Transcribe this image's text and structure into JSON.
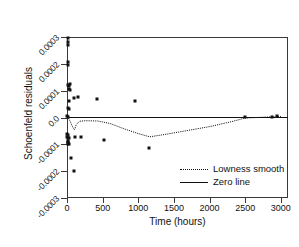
{
  "chart_data": {
    "type": "scatter",
    "title": "",
    "xlabel": "Time (hours)",
    "ylabel": "Schoenfeld residuals",
    "xlim": [
      0,
      3100
    ],
    "ylim": [
      -0.0003,
      0.0003
    ],
    "xticks": [
      0,
      500,
      1000,
      1500,
      2000,
      2500,
      3000
    ],
    "xticklabels": [
      "0",
      "500",
      "1000",
      "1500",
      "2000",
      "2500",
      "3000"
    ],
    "yticks": [
      0.0003,
      0.0002,
      0.0001,
      0.0,
      -0.0001,
      -0.0002,
      -0.0003
    ],
    "yticklabels": [
      "0.0003",
      "0.0002",
      "0.0001",
      "0.0",
      "-0.0001",
      "-0.0002",
      "-0.0003"
    ],
    "grid": false,
    "legend_position": "lower right",
    "legend": [
      {
        "label": "Lowness smooth",
        "style": "dotted"
      },
      {
        "label": "Zero line",
        "style": "solid"
      }
    ],
    "series": [
      {
        "name": "Schoenfeld residuals",
        "type": "scatter",
        "marker": "square",
        "color": "#111111",
        "points": [
          [
            10,
            0.000295
          ],
          [
            18,
            0.000282
          ],
          [
            14,
            0.00027
          ],
          [
            12,
            0.000205
          ],
          [
            20,
            0.000196
          ],
          [
            15,
            0.000122
          ],
          [
            30,
            0.000118
          ],
          [
            48,
            0.000124
          ],
          [
            22,
            0.000108
          ],
          [
            40,
            0.000104
          ],
          [
            25,
            6.2e-05
          ],
          [
            95,
            7.2e-05
          ],
          [
            160,
            7.5e-05
          ],
          [
            420,
            6.8e-05
          ],
          [
            950,
            6e-05
          ],
          [
            8,
            3.4e-05
          ],
          [
            35,
            3e-05
          ],
          [
            6,
            4e-06
          ],
          [
            14,
            2e-06
          ],
          [
            5,
            -6.2e-05
          ],
          [
            10,
            -6.6e-05
          ],
          [
            7,
            -7.4e-05
          ],
          [
            16,
            -7.8e-05
          ],
          [
            28,
            -7.6e-05
          ],
          [
            9,
            -8.6e-05
          ],
          [
            20,
            -9e-05
          ],
          [
            11,
            -9.5e-05
          ],
          [
            13,
            -0.0001
          ],
          [
            24,
            -9.8e-05
          ],
          [
            115,
            -7.2e-05
          ],
          [
            200,
            -7.4e-05
          ],
          [
            520,
            -8.2e-05
          ],
          [
            1150,
            -0.000112
          ],
          [
            60,
            -0.000152
          ],
          [
            100,
            -0.0002
          ],
          [
            2500,
            2e-06
          ],
          [
            2950,
            4e-06
          ],
          [
            2880,
            3e-06
          ]
        ]
      },
      {
        "name": "Lowness smooth",
        "type": "line",
        "style": "dotted",
        "color": "#111111",
        "points": [
          [
            0,
            6e-06
          ],
          [
            40,
            -1.2e-05
          ],
          [
            80,
            -3.6e-05
          ],
          [
            105,
            -4.6e-05
          ],
          [
            130,
            -2.6e-05
          ],
          [
            175,
            -1.4e-05
          ],
          [
            260,
            -1.2e-05
          ],
          [
            430,
            -1.3e-05
          ],
          [
            600,
            -2.2e-05
          ],
          [
            800,
            -4.2e-05
          ],
          [
            1000,
            -6e-05
          ],
          [
            1160,
            -7.2e-05
          ],
          [
            1400,
            -6.2e-05
          ],
          [
            1700,
            -4.8e-05
          ],
          [
            2000,
            -3.4e-05
          ],
          [
            2300,
            -1.6e-05
          ],
          [
            2500,
            -2e-06
          ],
          [
            2750,
            1e-06
          ],
          [
            3000,
            4e-06
          ]
        ]
      },
      {
        "name": "Zero line",
        "type": "line",
        "style": "solid",
        "color": "#111111",
        "points": [
          [
            0,
            0.0
          ],
          [
            3100,
            0.0
          ]
        ]
      }
    ]
  }
}
